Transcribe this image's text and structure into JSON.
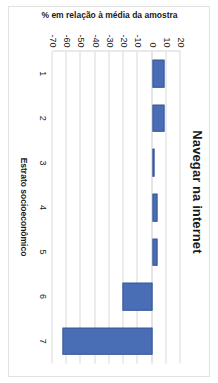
{
  "chart_data": {
    "type": "bar",
    "title": "Navegar na internet",
    "xlabel": "Estrato socioeconômico",
    "ylabel": "% em relação à média da amostra",
    "categories": [
      "1",
      "2",
      "3",
      "4",
      "5",
      "6",
      "7"
    ],
    "values": [
      9,
      9,
      2,
      4,
      4,
      -21,
      -63
    ],
    "ylim": [
      -70,
      20
    ],
    "yticks": [
      "20",
      "10",
      "0",
      "-10",
      "-20",
      "-30",
      "-40",
      "-50",
      "-60",
      "-70"
    ],
    "ytick_values": [
      20,
      10,
      0,
      -10,
      -20,
      -30,
      -40,
      -50,
      -60,
      -70
    ],
    "y_axis_inverted": true,
    "grid": true,
    "legend": "none",
    "series": [
      {
        "name": "% em relação à média da amostra",
        "values": [
          9,
          9,
          2,
          4,
          4,
          -21,
          -63
        ],
        "color": "#4a6eb5"
      }
    ],
    "orientation": "rotated-90-clockwise"
  },
  "colors": {
    "bar": "#4a6eb5",
    "bar_border": "#3a5998",
    "grid": "#d9d9d9",
    "frame": "#e2e2e2",
    "text": "#1a1a1a",
    "background": "#ffffff"
  }
}
